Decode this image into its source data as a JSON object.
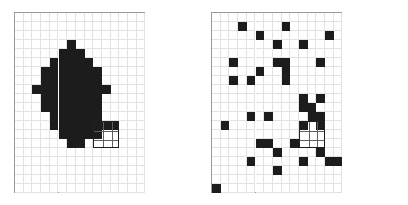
{
  "figure": {
    "title": "",
    "background_color": "#ffffff",
    "panel_border_color": "#9a9a9a",
    "grid_line_color": "#e2e2e2",
    "filled_cell_color": "#1c1c1c",
    "selection_outline_color": "#202020"
  },
  "grid": {
    "columns": 15,
    "rows": 20,
    "cell_width": 8.7,
    "cell_height": 9.0
  },
  "panels": [
    {
      "id": "clustered",
      "label": "",
      "selection_box": {
        "col": 9,
        "row": 12,
        "width": 3,
        "height": 3
      },
      "filled_cells": [
        [
          6,
          3
        ],
        [
          5,
          4
        ],
        [
          6,
          4
        ],
        [
          7,
          4
        ],
        [
          4,
          5
        ],
        [
          5,
          5
        ],
        [
          6,
          5
        ],
        [
          7,
          5
        ],
        [
          8,
          5
        ],
        [
          3,
          6
        ],
        [
          4,
          6
        ],
        [
          5,
          6
        ],
        [
          6,
          6
        ],
        [
          7,
          6
        ],
        [
          8,
          6
        ],
        [
          9,
          6
        ],
        [
          3,
          7
        ],
        [
          4,
          7
        ],
        [
          5,
          7
        ],
        [
          6,
          7
        ],
        [
          7,
          7
        ],
        [
          8,
          7
        ],
        [
          9,
          7
        ],
        [
          2,
          8
        ],
        [
          3,
          8
        ],
        [
          4,
          8
        ],
        [
          5,
          8
        ],
        [
          6,
          8
        ],
        [
          7,
          8
        ],
        [
          8,
          8
        ],
        [
          9,
          8
        ],
        [
          10,
          8
        ],
        [
          3,
          9
        ],
        [
          4,
          9
        ],
        [
          5,
          9
        ],
        [
          6,
          9
        ],
        [
          7,
          9
        ],
        [
          8,
          9
        ],
        [
          9,
          9
        ],
        [
          3,
          10
        ],
        [
          4,
          10
        ],
        [
          5,
          10
        ],
        [
          6,
          10
        ],
        [
          7,
          10
        ],
        [
          8,
          10
        ],
        [
          9,
          10
        ],
        [
          4,
          11
        ],
        [
          5,
          11
        ],
        [
          6,
          11
        ],
        [
          7,
          11
        ],
        [
          8,
          11
        ],
        [
          9,
          11
        ],
        [
          4,
          12
        ],
        [
          5,
          12
        ],
        [
          6,
          12
        ],
        [
          7,
          12
        ],
        [
          8,
          12
        ],
        [
          9,
          12
        ],
        [
          10,
          12
        ],
        [
          11,
          12
        ],
        [
          5,
          13
        ],
        [
          6,
          13
        ],
        [
          7,
          13
        ],
        [
          8,
          13
        ],
        [
          9,
          13
        ],
        [
          6,
          14
        ],
        [
          7,
          14
        ]
      ]
    },
    {
      "id": "scattered",
      "label": "",
      "selection_box": {
        "col": 10,
        "row": 12,
        "width": 3,
        "height": 3
      },
      "filled_cells": [
        [
          3,
          1
        ],
        [
          8,
          1
        ],
        [
          5,
          2
        ],
        [
          13,
          2
        ],
        [
          7,
          3
        ],
        [
          10,
          3
        ],
        [
          16,
          3
        ],
        [
          2,
          5
        ],
        [
          7,
          5
        ],
        [
          8,
          5
        ],
        [
          12,
          5
        ],
        [
          15,
          5
        ],
        [
          5,
          6
        ],
        [
          8,
          6
        ],
        [
          2,
          7
        ],
        [
          4,
          7
        ],
        [
          8,
          7
        ],
        [
          10,
          9
        ],
        [
          12,
          9
        ],
        [
          10,
          10
        ],
        [
          11,
          10
        ],
        [
          4,
          11
        ],
        [
          6,
          11
        ],
        [
          11,
          11
        ],
        [
          12,
          11
        ],
        [
          15,
          11
        ],
        [
          17,
          11
        ],
        [
          10,
          12
        ],
        [
          12,
          12
        ],
        [
          1,
          12
        ],
        [
          5,
          14
        ],
        [
          6,
          14
        ],
        [
          9,
          14
        ],
        [
          15,
          14
        ],
        [
          7,
          15
        ],
        [
          12,
          15
        ],
        [
          13,
          16
        ],
        [
          4,
          16
        ],
        [
          10,
          16
        ],
        [
          14,
          16
        ],
        [
          7,
          17
        ],
        [
          0,
          19
        ]
      ]
    }
  ]
}
